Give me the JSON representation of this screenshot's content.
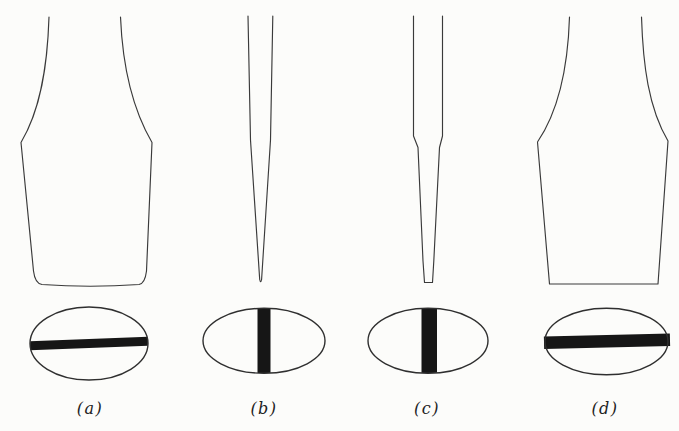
{
  "figure": {
    "type": "screwdriver-tip-shapes-diagram",
    "background_color": "#fcfcfa",
    "line_color": "#3a3a3a",
    "bar_fill_color": "#161616",
    "panels": [
      {
        "label": "(a)",
        "profile_shape": "wide-flared-blade-front-view-rounded-bottom",
        "slot_bar_orientation": "horizontal",
        "slot_bar_extent": "full-width-of-ellipse"
      },
      {
        "label": "(b)",
        "profile_shape": "thin-blade-side-view-tapered-to-sharp-point",
        "slot_bar_orientation": "vertical",
        "slot_bar_extent": "full-height-of-ellipse"
      },
      {
        "label": "(c)",
        "profile_shape": "thin-blade-side-view-stepped-taper-flat-tip",
        "slot_bar_orientation": "vertical",
        "slot_bar_extent": "full-height-of-ellipse"
      },
      {
        "label": "(d)",
        "profile_shape": "wide-flared-blade-front-view-flat-bottom",
        "slot_bar_orientation": "horizontal",
        "slot_bar_extent": "full-width-slightly-beyond-ellipse"
      }
    ]
  }
}
